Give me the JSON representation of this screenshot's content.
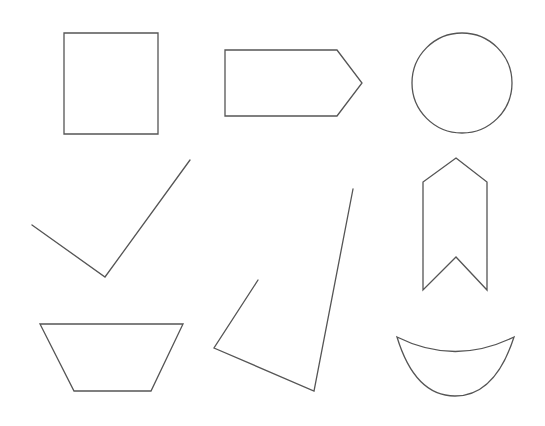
{
  "canvas": {
    "width": 545,
    "height": 426,
    "background": "#ffffff",
    "stroke_color": "#555555"
  },
  "shapes": [
    {
      "name": "square",
      "type": "polygon",
      "points": "64,33 158,33 158,134 64,134"
    },
    {
      "name": "pentagon-arrow",
      "type": "polygon",
      "points": "225,50 337,50 362,83 337,116 225,116"
    },
    {
      "name": "circle",
      "type": "circle",
      "cx": 462,
      "cy": 83,
      "r": 50
    },
    {
      "name": "checkmark",
      "type": "polyline",
      "points": "32,225 105,277 190,160"
    },
    {
      "name": "bookmark-chevron",
      "type": "polygon",
      "points": "456,158 487,182 487,290 456,257 423,290 423,182"
    },
    {
      "name": "open-quadrilateral",
      "type": "polyline",
      "points": "258,280 214,348 314,391 353,189"
    },
    {
      "name": "trapezoid",
      "type": "polygon",
      "points": "40,324 183,324 151,391 74,391"
    },
    {
      "name": "crescent-bowl",
      "type": "path",
      "d": "M397,337 Q455,366 514,337 Q495,396 455,396 Q415,396 397,337 Z"
    }
  ]
}
